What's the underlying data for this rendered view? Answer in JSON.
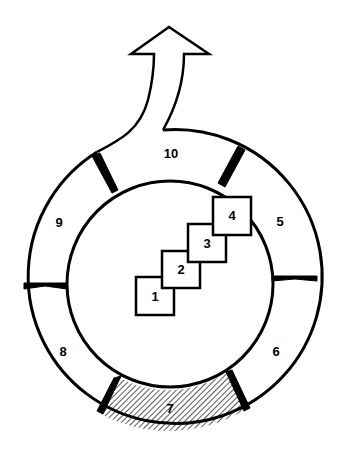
{
  "diagram": {
    "type": "ring-cycle-with-steps",
    "colors": {
      "stroke": "#000000",
      "fill": "#ffffff",
      "hatch": "#000000"
    },
    "steps": [
      {
        "id": 1,
        "label": "1"
      },
      {
        "id": 2,
        "label": "2"
      },
      {
        "id": 3,
        "label": "3"
      },
      {
        "id": 4,
        "label": "4"
      }
    ],
    "ring_segments": [
      {
        "id": 5,
        "label": "5"
      },
      {
        "id": 6,
        "label": "6"
      },
      {
        "id": 7,
        "label": "7",
        "hatched": true
      },
      {
        "id": 8,
        "label": "8"
      },
      {
        "id": 9,
        "label": "9"
      },
      {
        "id": 10,
        "label": "10",
        "exit_arrow": true
      }
    ]
  }
}
